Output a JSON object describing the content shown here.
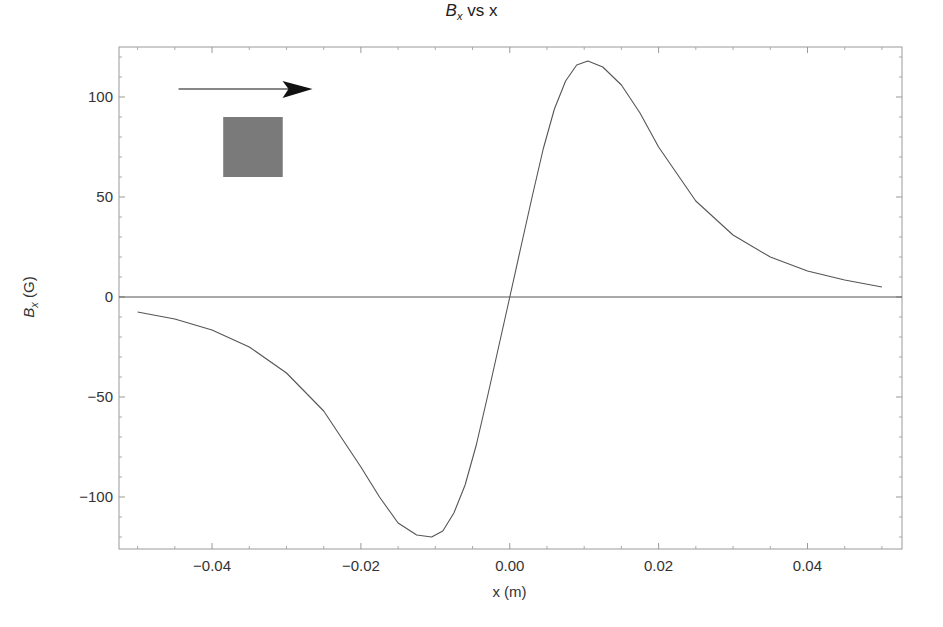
{
  "chart_data": {
    "type": "line",
    "title_parts": {
      "main": "B",
      "sub": "x",
      "rest": " vs x"
    },
    "xlabel": "x (m)",
    "ylabel": "B_x (G)",
    "ylabel_parts": {
      "main": "B",
      "sub": "x",
      "rest": " (G)"
    },
    "xlim": [
      -0.0525,
      0.0527
    ],
    "ylim": [
      -126,
      125
    ],
    "x_ticks": [
      -0.04,
      -0.02,
      0.0,
      0.02,
      0.04
    ],
    "x_tick_labels": [
      "−0.04",
      "−0.02",
      "0.00",
      "0.02",
      "0.04"
    ],
    "y_ticks": [
      -100,
      -50,
      0,
      50,
      100
    ],
    "y_tick_labels": [
      "−100",
      "−50",
      "0",
      "50",
      "100"
    ],
    "grid": false,
    "legend": null,
    "series": [
      {
        "name": "B_x",
        "color": "#555555",
        "x": [
          -0.05,
          -0.045,
          -0.04,
          -0.035,
          -0.03,
          -0.025,
          -0.02,
          -0.0175,
          -0.015,
          -0.0125,
          -0.0105,
          -0.009,
          -0.0075,
          -0.006,
          -0.0045,
          -0.003,
          -0.0015,
          0.0,
          0.0015,
          0.003,
          0.0045,
          0.006,
          0.0075,
          0.009,
          0.0105,
          0.0125,
          0.015,
          0.0175,
          0.02,
          0.025,
          0.03,
          0.035,
          0.04,
          0.045,
          0.05
        ],
        "y": [
          -7.5,
          -11,
          -16.5,
          -25,
          -38,
          -57,
          -85,
          -100,
          -113,
          -119,
          -120,
          -117,
          -108,
          -94,
          -74,
          -50,
          -25,
          0,
          25,
          50,
          74,
          94,
          108,
          116,
          118,
          115,
          106,
          92,
          75,
          48,
          31,
          20,
          13,
          8.5,
          5
        ]
      },
      {
        "name": "zero line",
        "color": "#555555",
        "x": [
          -0.0525,
          0.0527
        ],
        "y": [
          0,
          0
        ]
      }
    ],
    "annotations": [
      {
        "type": "arrow",
        "direction": "right",
        "from": [
          -0.0445,
          104
        ],
        "to": [
          -0.0265,
          104
        ],
        "color": "#111111"
      },
      {
        "type": "rectangle",
        "label": "magnet",
        "x0": -0.0385,
        "x1": -0.0305,
        "y0": 60,
        "y1": 90,
        "color": "#7a7a7a"
      }
    ]
  },
  "plot_area": {
    "left": 119,
    "top": 47,
    "right": 902,
    "bottom": 549
  }
}
